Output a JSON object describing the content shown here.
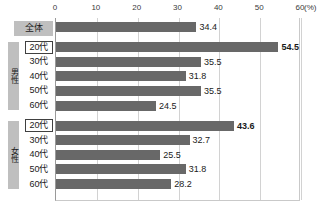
{
  "chart_data": {
    "type": "bar",
    "orientation": "horizontal",
    "title": "",
    "xlabel": "(%)",
    "ylabel": "",
    "xlim": [
      0,
      60
    ],
    "xticks": [
      0,
      10,
      20,
      30,
      40,
      50,
      60
    ],
    "unit_label": "(%)",
    "grid": true,
    "legend": "none",
    "bar_color": "#686868",
    "categories": [
      "全体",
      "20代",
      "30代",
      "40代",
      "50代",
      "60代",
      "20代",
      "30代",
      "40代",
      "50代",
      "60代"
    ],
    "values": [
      34.4,
      54.5,
      35.5,
      31.8,
      35.5,
      24.5,
      43.6,
      32.7,
      25.5,
      31.8,
      28.2
    ],
    "groups": [
      {
        "name": "",
        "categories": [
          "全体"
        ],
        "values": [
          34.4
        ]
      },
      {
        "name": "男性",
        "categories": [
          "20代",
          "30代",
          "40代",
          "50代",
          "60代"
        ],
        "values": [
          54.5,
          35.5,
          31.8,
          35.5,
          24.5
        ]
      },
      {
        "name": "女性",
        "categories": [
          "20代",
          "30代",
          "40代",
          "50代",
          "60代"
        ],
        "values": [
          43.6,
          32.7,
          25.5,
          31.8,
          28.2
        ]
      }
    ]
  },
  "rows": [
    {
      "label": "全体",
      "value": "34.4",
      "num": 34.4,
      "style": "filled",
      "emph": false
    },
    {
      "label": "20代",
      "value": "54.5",
      "num": 54.5,
      "style": "boxed",
      "emph": true
    },
    {
      "label": "30代",
      "value": "35.5",
      "num": 35.5,
      "style": "plain",
      "emph": false
    },
    {
      "label": "40代",
      "value": "31.8",
      "num": 31.8,
      "style": "plain",
      "emph": false
    },
    {
      "label": "50代",
      "value": "35.5",
      "num": 35.5,
      "style": "plain",
      "emph": false
    },
    {
      "label": "60代",
      "value": "24.5",
      "num": 24.5,
      "style": "plain",
      "emph": false
    },
    {
      "label": "20代",
      "value": "43.6",
      "num": 43.6,
      "style": "boxed",
      "emph": true
    },
    {
      "label": "30代",
      "value": "32.7",
      "num": 32.7,
      "style": "plain",
      "emph": false
    },
    {
      "label": "40代",
      "value": "25.5",
      "num": 25.5,
      "style": "plain",
      "emph": false
    },
    {
      "label": "50代",
      "value": "31.8",
      "num": 31.8,
      "style": "plain",
      "emph": false
    },
    {
      "label": "60代",
      "value": "28.2",
      "num": 28.2,
      "style": "plain",
      "emph": false
    }
  ],
  "group_tabs": [
    {
      "name": "男性",
      "start_row": 1,
      "end_row": 5
    },
    {
      "name": "女性",
      "start_row": 6,
      "end_row": 10
    }
  ]
}
